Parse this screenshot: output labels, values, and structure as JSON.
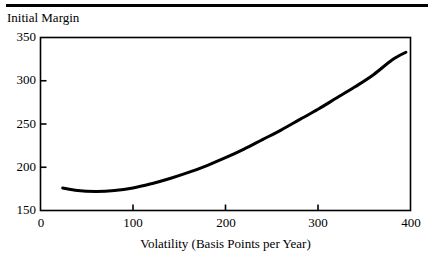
{
  "figure": {
    "background": "#ffffff",
    "ink_color": "#000000",
    "top_rule": true
  },
  "chart_data": {
    "type": "line",
    "title": "",
    "xlabel": "Volatility (Basis Points per Year)",
    "ylabel": "Initial Margin",
    "ylabel_position": "above-axis",
    "xlim": [
      0,
      400
    ],
    "ylim": [
      150,
      350
    ],
    "xticks": [
      0,
      100,
      200,
      300,
      400
    ],
    "yticks": [
      150,
      200,
      250,
      300,
      350
    ],
    "xtick_labels": [
      "0",
      "100",
      "200",
      "300",
      "400"
    ],
    "ytick_labels": [
      "150",
      "200",
      "250",
      "300",
      "350"
    ],
    "grid": false,
    "legend": null,
    "frame": "box",
    "tick_direction": "in",
    "series": [
      {
        "name": "Initial Margin vs Volatility",
        "color": "#000000",
        "line_width": 3,
        "x": [
          24,
          40,
          60,
          80,
          100,
          120,
          140,
          160,
          180,
          200,
          220,
          240,
          260,
          280,
          300,
          320,
          340,
          360,
          380,
          395
        ],
        "y": [
          176,
          173,
          172,
          173,
          176,
          181,
          187,
          194,
          202,
          211,
          221,
          232,
          243,
          255,
          267,
          280,
          293,
          307,
          324,
          333
        ]
      }
    ]
  }
}
